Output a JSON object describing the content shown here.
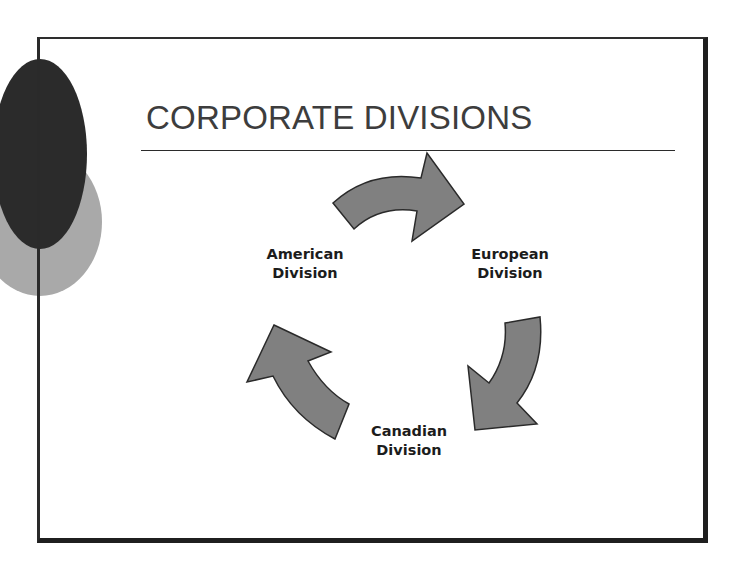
{
  "slide": {
    "title": "CORPORATE DIVISIONS",
    "colors": {
      "background": "#ffffff",
      "frame": "#1f1f1f",
      "title_text": "#3d3d3d",
      "dark_circle": "#2b2b2b",
      "light_circle": "#a9a9a9",
      "arrow_fill": "#808080",
      "arrow_stroke": "#2a2a2a",
      "label_text": "#1c1c1c"
    }
  },
  "diagram": {
    "type": "cycle",
    "nodes": [
      {
        "id": "american",
        "line1": "American",
        "line2": "Division"
      },
      {
        "id": "european",
        "line1": "European",
        "line2": "Division"
      },
      {
        "id": "canadian",
        "line1": "Canadian",
        "line2": "Division"
      }
    ],
    "edges": [
      {
        "from": "American Division",
        "to": "European Division",
        "icon": "curved-arrow-right"
      },
      {
        "from": "European Division",
        "to": "Canadian Division",
        "icon": "curved-arrow-down"
      },
      {
        "from": "Canadian Division",
        "to": "American Division",
        "icon": "curved-arrow-up"
      }
    ]
  }
}
